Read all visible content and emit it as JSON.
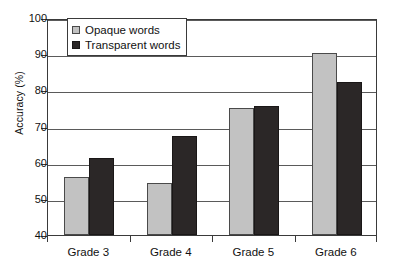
{
  "chart_data": {
    "type": "bar",
    "title": "",
    "xlabel": "",
    "ylabel": "Accuracy (%)",
    "categories": [
      "Grade 3",
      "Grade 4",
      "Grade 5",
      "Grade 6"
    ],
    "series": [
      {
        "name": "Opaque words",
        "color": "#c2c2c2",
        "values": [
          56.0,
          54.4,
          75.0,
          90.3
        ]
      },
      {
        "name": "Transparent words",
        "color": "#2b2727",
        "values": [
          61.3,
          67.3,
          75.6,
          82.3
        ]
      }
    ],
    "ylim": [
      40,
      100
    ],
    "yticks": [
      40,
      50,
      60,
      70,
      80,
      90,
      100
    ],
    "ytick_labels": [
      "40",
      "50",
      "60",
      "70",
      "80",
      "90",
      "100"
    ],
    "grid": true,
    "legend_position": "top-left-inside"
  },
  "legend": {
    "items": [
      {
        "label": "Opaque words",
        "swatch": "opaque"
      },
      {
        "label": "Transparent words",
        "swatch": "transparent"
      }
    ]
  }
}
